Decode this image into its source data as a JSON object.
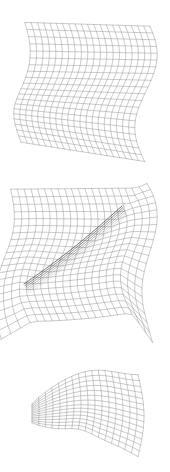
{
  "figure": {
    "title": "",
    "background_color": "#ffffff",
    "width": 170,
    "height": 472,
    "panel_count": 3
  },
  "style": {
    "mesh_color": "#8a8a8a",
    "mesh_color_dark": "#4a4a4a",
    "fold_color": "#2e2e2e",
    "mesh_line_width": 0.45,
    "fold_line_width": 0.8
  },
  "panels": [
    {
      "id": "panel-top",
      "name": "undeformed-wavy-sheet",
      "caption": "",
      "description": "Wireframe quadrilateral mesh of a smooth S-curved (wavy) sheet viewed in perspective",
      "grid": {
        "u_divisions": 20,
        "v_divisions": 20
      },
      "bbox": {
        "x": 22,
        "y": 25,
        "width": 124,
        "height": 130
      }
    },
    {
      "id": "panel-middle",
      "name": "folded-sheet-with-crease",
      "caption": "",
      "description": "Same wavy sheet after folding, showing a dark diagonal crease from lower-left to upper-right, with flared skirts at left and right",
      "grid": {
        "u_divisions": 20,
        "v_divisions": 20
      },
      "bbox": {
        "x": 8,
        "y": 178,
        "width": 152,
        "height": 168
      },
      "fold": {
        "label": "crease",
        "start": {
          "x": 24,
          "y": 284
        },
        "end": {
          "x": 122,
          "y": 206
        }
      }
    },
    {
      "id": "panel-bottom",
      "name": "pinched-lobe-surface",
      "caption": "",
      "description": "Wireframe mesh of a pinched, bulging lobe surface with a narrow flat neck extending to the left",
      "grid": {
        "u_divisions": 16,
        "v_divisions": 14
      },
      "bbox": {
        "x": 32,
        "y": 366,
        "width": 106,
        "height": 86
      }
    }
  ],
  "chart_data": {
    "type": "line",
    "title": "",
    "xlabel": "",
    "ylabel": "",
    "series": [
      {
        "name": "panel-top-mesh",
        "values": []
      },
      {
        "name": "panel-middle-mesh",
        "values": []
      },
      {
        "name": "panel-bottom-mesh",
        "values": []
      }
    ]
  }
}
